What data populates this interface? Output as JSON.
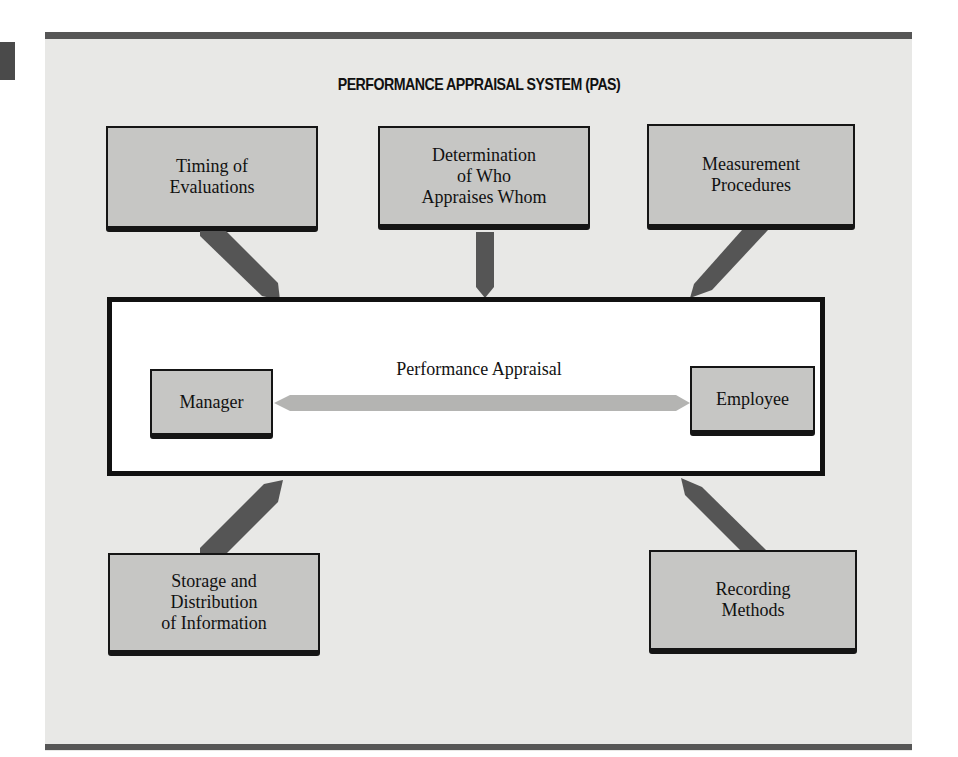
{
  "diagram": {
    "title": "PERFORMANCE APPRAISAL SYSTEM (PAS)",
    "center": {
      "label": "Performance Appraisal",
      "left_node": "Manager",
      "right_node": "Employee",
      "connector": "bidirectional-arrow"
    },
    "nodes": [
      {
        "id": "timing",
        "label": "Timing of\nEvaluations",
        "position": "top-left"
      },
      {
        "id": "who",
        "label": "Determination\nof Who\nAppraises Whom",
        "position": "top-center"
      },
      {
        "id": "measurement",
        "label": "Measurement\nProcedures",
        "position": "top-right"
      },
      {
        "id": "storage",
        "label": "Storage and\nDistribution\nof Information",
        "position": "bottom-left"
      },
      {
        "id": "recording",
        "label": "Recording\nMethods",
        "position": "bottom-right"
      }
    ],
    "colors": {
      "panel_bg": "#e8e8e6",
      "box_fill": "#c6c6c4",
      "border": "#151515",
      "arrow": "#555555",
      "double_arrow": "#b4b4b2",
      "rule": "#565656"
    }
  }
}
